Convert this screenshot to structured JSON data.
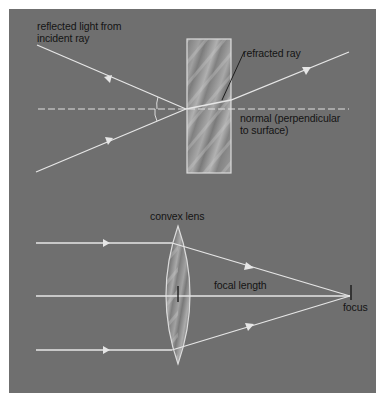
{
  "colors": {
    "background": "#6f6f6f",
    "ray": "#e6e6e6",
    "label": "#141414",
    "glass": "#8a8a8a"
  },
  "refraction": {
    "labels": {
      "reflected_line1": "reflected light from",
      "reflected_line2": "incident ray",
      "refracted": "refracted ray",
      "normal_line1": "normal (perpendicular",
      "normal_line2": "to surface)"
    }
  },
  "lens": {
    "labels": {
      "lens": "convex lens",
      "focal_length": "focal length",
      "focus": "focus"
    }
  }
}
